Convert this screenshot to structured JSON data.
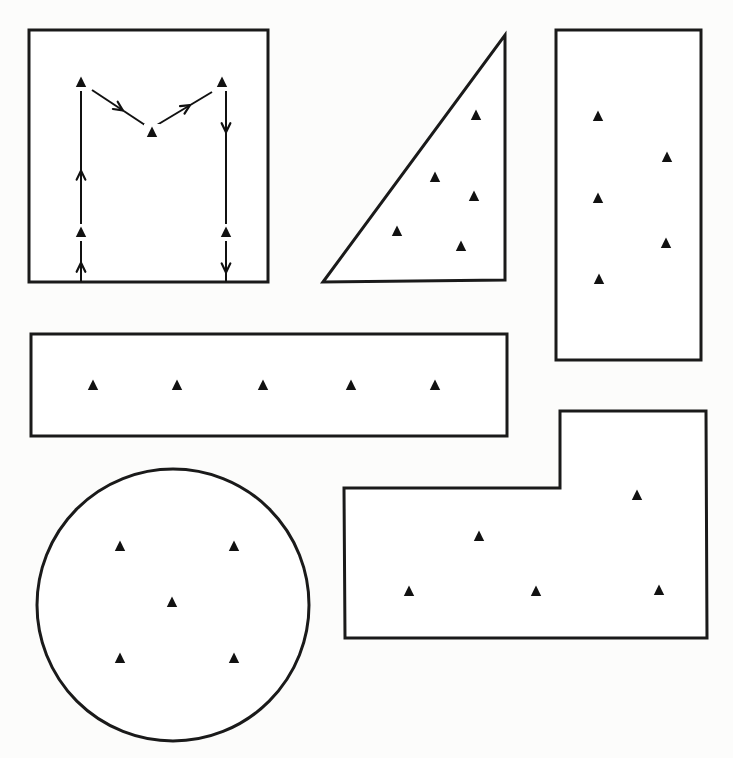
{
  "figure": {
    "colors": {
      "outline": "#1a1a1a",
      "marker": "#111111",
      "background": "#fcfcfb"
    },
    "marker_icon": "filled-triangle-icon",
    "shapes": [
      {
        "id": "square",
        "type": "rect",
        "x": 29,
        "y": 30,
        "w": 239,
        "h": 252,
        "label": "Square plot with M-shaped (traverse) sampling route",
        "points": [
          [
            81,
            83
          ],
          [
            152,
            133
          ],
          [
            222,
            83
          ],
          [
            81,
            233
          ],
          [
            226,
            233
          ]
        ],
        "route": [
          [
            81,
            282
          ],
          [
            81,
            90
          ],
          [
            92,
            90
          ],
          [
            148,
            127
          ],
          [
            157,
            125
          ],
          [
            212,
            92
          ],
          [
            226,
            90
          ],
          [
            226,
            282
          ]
        ]
      },
      {
        "id": "triangle",
        "type": "polygon",
        "vertices": [
          [
            323,
            282
          ],
          [
            505,
            35
          ],
          [
            505,
            280
          ]
        ],
        "label": "Right-triangle plot",
        "points": [
          [
            476,
            116
          ],
          [
            435,
            178
          ],
          [
            474,
            197
          ],
          [
            397,
            232
          ],
          [
            461,
            247
          ]
        ]
      },
      {
        "id": "tall-rectangle",
        "type": "rect",
        "x": 556,
        "y": 30,
        "w": 145,
        "h": 330,
        "label": "Tall rectangular plot (zig-zag)",
        "points": [
          [
            598,
            117
          ],
          [
            667,
            158
          ],
          [
            598,
            199
          ],
          [
            666,
            244
          ],
          [
            599,
            280
          ]
        ]
      },
      {
        "id": "wide-rectangle",
        "type": "rect",
        "x": 31,
        "y": 334,
        "w": 476,
        "h": 102,
        "label": "Long narrow strip plot (linear)",
        "points": [
          [
            93,
            386
          ],
          [
            177,
            386
          ],
          [
            263,
            386
          ],
          [
            351,
            386
          ],
          [
            435,
            386
          ]
        ]
      },
      {
        "id": "l-shape",
        "type": "polygon",
        "vertices": [
          [
            344,
            488
          ],
          [
            560,
            488
          ],
          [
            560,
            411
          ],
          [
            706,
            411
          ],
          [
            707,
            638
          ],
          [
            345,
            638
          ]
        ],
        "label": "L-shaped plot",
        "points": [
          [
            637,
            496
          ],
          [
            479,
            537
          ],
          [
            409,
            592
          ],
          [
            536,
            592
          ],
          [
            659,
            591
          ]
        ]
      },
      {
        "id": "circle",
        "type": "circle",
        "cx": 173,
        "cy": 605,
        "r": 136,
        "label": "Circular plot (five-spot)",
        "points": [
          [
            120,
            547
          ],
          [
            234,
            547
          ],
          [
            172,
            603
          ],
          [
            120,
            659
          ],
          [
            234,
            659
          ]
        ]
      }
    ]
  }
}
